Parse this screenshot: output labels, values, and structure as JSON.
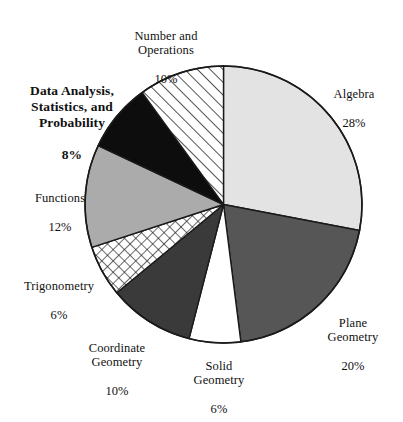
{
  "chart_data": {
    "type": "pie",
    "title": "",
    "subtitle": "",
    "xlabel": "",
    "ylabel": "",
    "legend_position": "labels-around-pie",
    "grid": false,
    "start_angle_deg": 0,
    "direction": "clockwise",
    "units": "percent",
    "total": 100,
    "categories": [
      "Algebra",
      "Plane Geometry",
      "Solid Geometry",
      "Coordinate Geometry",
      "Trigonometry",
      "Functions",
      "Data Analysis, Statistics, and Probability",
      "Number and Operations"
    ],
    "values": [
      28,
      20,
      6,
      10,
      6,
      12,
      8,
      10
    ],
    "slices": [
      {
        "id": "algebra",
        "label": "Algebra",
        "label_lines": "Algebra",
        "value": 28,
        "value_text": "28%",
        "fill": "#e3e3e3",
        "pattern": "solid",
        "stroke": "#1a1a1a",
        "emphasis": "normal"
      },
      {
        "id": "plane-geometry",
        "label": "Plane Geometry",
        "label_lines": "Plane\nGeometry",
        "value": 20,
        "value_text": "20%",
        "fill": "#565656",
        "pattern": "solid",
        "stroke": "#1a1a1a",
        "emphasis": "normal"
      },
      {
        "id": "solid-geometry",
        "label": "Solid Geometry",
        "label_lines": "Solid\nGeometry",
        "value": 6,
        "value_text": "6%",
        "fill": "#ffffff",
        "pattern": "solid",
        "stroke": "#1a1a1a",
        "emphasis": "normal"
      },
      {
        "id": "coordinate-geometry",
        "label": "Coordinate Geometry",
        "label_lines": "Coordinate\nGeometry",
        "value": 10,
        "value_text": "10%",
        "fill": "#3a3a3a",
        "pattern": "solid",
        "stroke": "#1a1a1a",
        "emphasis": "normal"
      },
      {
        "id": "trigonometry",
        "label": "Trigonometry",
        "label_lines": "Trigonometry",
        "value": 6,
        "value_text": "6%",
        "fill": "#ffffff",
        "pattern": "crosshatch",
        "stroke": "#1a1a1a",
        "emphasis": "normal"
      },
      {
        "id": "functions",
        "label": "Functions",
        "label_lines": "Functions",
        "value": 12,
        "value_text": "12%",
        "fill": "#ababab",
        "pattern": "solid",
        "stroke": "#1a1a1a",
        "emphasis": "normal"
      },
      {
        "id": "data-analysis",
        "label": "Data Analysis, Statistics, and Probability",
        "label_lines": "Data Analysis,\nStatistics, and\nProbability",
        "value": 8,
        "value_text": "8%",
        "fill": "#0d0d0d",
        "pattern": "solid",
        "stroke": "#1a1a1a",
        "emphasis": "bold"
      },
      {
        "id": "number-and-operations",
        "label": "Number and Operations",
        "label_lines": "Number and\nOperations",
        "value": 10,
        "value_text": "10%",
        "fill": "#ffffff",
        "pattern": "diagonal-hatch",
        "stroke": "#1a1a1a",
        "emphasis": "normal"
      }
    ]
  },
  "colors": {
    "background": "#ffffff",
    "outline": "#1a1a1a",
    "text": "#111111"
  }
}
